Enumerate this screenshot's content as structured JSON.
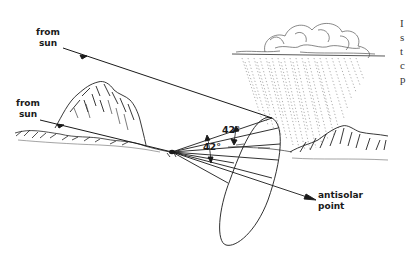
{
  "diagram": {
    "labels": {
      "from_sun_upper": [
        "from",
        "sun"
      ],
      "from_sun_lower": [
        "from",
        "sun"
      ],
      "angle_upper": "42°",
      "angle_lower": "42°",
      "antisolar_point": [
        "antisolar",
        "point"
      ]
    },
    "cutoff_text_right": [
      "I",
      "s",
      "t",
      "c",
      "p"
    ],
    "colors": {
      "ink": "#1a1a1a",
      "background": "#ffffff"
    }
  }
}
